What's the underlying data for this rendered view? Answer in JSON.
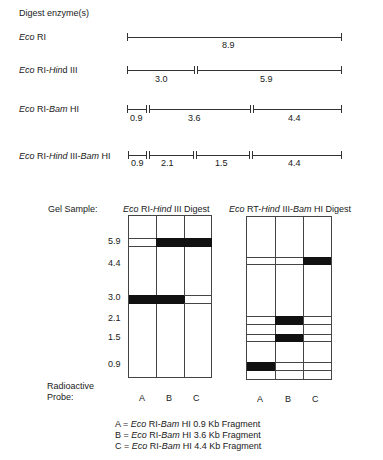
{
  "header": {
    "title": "Digest enzyme(s)"
  },
  "digests": [
    {
      "label_parts": [
        {
          "t": "Eco",
          "i": true
        },
        {
          "t": " RI",
          "i": false
        }
      ],
      "fragments": [
        "8.9"
      ]
    },
    {
      "label_parts": [
        {
          "t": "Eco",
          "i": true
        },
        {
          "t": " RI-",
          "i": false
        },
        {
          "t": "Hin",
          "i": true
        },
        {
          "t": "d III",
          "i": false
        }
      ],
      "fragments": [
        "3.0",
        "5.9"
      ]
    },
    {
      "label_parts": [
        {
          "t": "Eco",
          "i": true
        },
        {
          "t": " RI-",
          "i": false
        },
        {
          "t": "Bam",
          "i": true
        },
        {
          "t": " HI",
          "i": false
        }
      ],
      "fragments": [
        "0.9",
        "3.6",
        "4.4"
      ]
    },
    {
      "label_parts": [
        {
          "t": "Eco",
          "i": true
        },
        {
          "t": " RI-",
          "i": false
        },
        {
          "t": "Hind",
          "i": true
        },
        {
          "t": " III-",
          "i": false
        },
        {
          "t": "Bam",
          "i": true
        },
        {
          "t": " HI",
          "i": false
        }
      ],
      "fragments": [
        "0.9",
        "2.1",
        "1.5",
        "4.4"
      ]
    }
  ],
  "gel": {
    "sample_label": "Gel Sample:",
    "gel1_title_parts": [
      {
        "t": "Eco",
        "i": true
      },
      {
        "t": " RI-",
        "i": false
      },
      {
        "t": "Hind",
        "i": true
      },
      {
        "t": " III Digest",
        "i": false
      }
    ],
    "gel2_title_parts": [
      {
        "t": "Eco",
        "i": true
      },
      {
        "t": " RT-",
        "i": false
      },
      {
        "t": "Hind",
        "i": true
      },
      {
        "t": " III-",
        "i": false
      },
      {
        "t": "Bam",
        "i": true
      },
      {
        "t": " HI Digest",
        "i": false
      }
    ],
    "size_labels": [
      "5.9",
      "4.4",
      "3.0",
      "2.1",
      "1.5",
      "0.9"
    ],
    "probe_label_line1": "Radioactive",
    "probe_label_line2": "Probe:",
    "lanes": [
      "A",
      "B",
      "C"
    ],
    "gel1_bands": {
      "5.9": [
        "empty",
        "filled",
        "filled"
      ],
      "3.0": [
        "filled",
        "filled",
        "empty"
      ]
    },
    "gel2_bands": {
      "4.4": [
        "empty",
        "empty",
        "filled"
      ],
      "2.1": [
        "empty",
        "filled",
        "empty"
      ],
      "1.5": [
        "empty",
        "filled",
        "empty"
      ],
      "0.9": [
        "filled",
        "empty",
        "empty"
      ]
    }
  },
  "legend": [
    {
      "key": "A",
      "parts": [
        {
          "t": "A = ",
          "i": false
        },
        {
          "t": "Eco",
          "i": true
        },
        {
          "t": " RI-",
          "i": false
        },
        {
          "t": "Bam",
          "i": true
        },
        {
          "t": " HI 0.9 Kb Fragment",
          "i": false
        }
      ]
    },
    {
      "key": "B",
      "parts": [
        {
          "t": "B = ",
          "i": false
        },
        {
          "t": "Eco",
          "i": true
        },
        {
          "t": " RI-",
          "i": false
        },
        {
          "t": "Bam",
          "i": true
        },
        {
          "t": " HI 3.6 Kb Fragment",
          "i": false
        }
      ]
    },
    {
      "key": "C",
      "parts": [
        {
          "t": "C = ",
          "i": false
        },
        {
          "t": "Eco",
          "i": true
        },
        {
          "t": " RI-",
          "i": false
        },
        {
          "t": "Bam",
          "i": true
        },
        {
          "t": " HI 4.4 Kb Fragment",
          "i": false
        }
      ]
    }
  ]
}
